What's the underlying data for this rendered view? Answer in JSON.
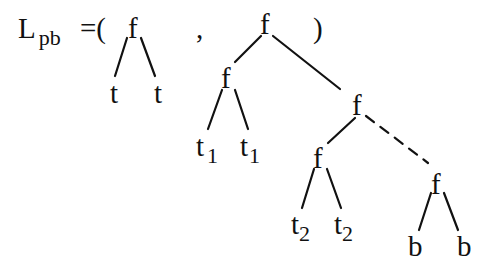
{
  "equation": {
    "lhs": "L",
    "lhs_subscript": "pb",
    "equals_open": "=(",
    "comma": ",",
    "close": ")"
  },
  "tree1": {
    "root": "f",
    "leaves": [
      "t",
      "t"
    ]
  },
  "tree2": {
    "root": "f",
    "left": {
      "node": "f",
      "leaves": [
        {
          "base": "t",
          "sub": "1"
        },
        {
          "base": "t",
          "sub": "1"
        }
      ]
    },
    "right": {
      "node": "f",
      "left": {
        "node": "f",
        "leaves": [
          {
            "base": "t",
            "sub": "2"
          },
          {
            "base": "t",
            "sub": "2"
          }
        ]
      },
      "right_dashed": {
        "node": "f",
        "leaves": [
          "b",
          "b"
        ]
      }
    }
  }
}
